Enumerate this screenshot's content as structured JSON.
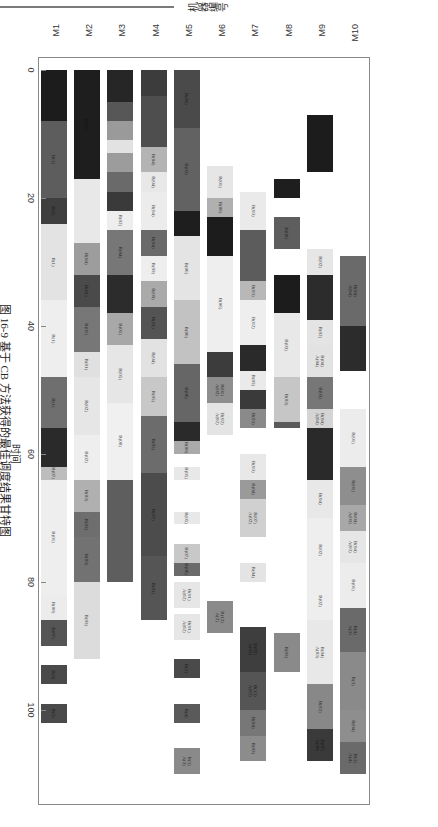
{
  "chart_data": {
    "type": "gantt",
    "title": "",
    "caption": "图 16-9 基于 CB 方法获得的最佳调度结果甘特图",
    "xlabel": "时间",
    "ylabel": "机器编号",
    "xlim": [
      0,
      117
    ],
    "xticks": [
      0,
      20,
      40,
      60,
      80,
      100
    ],
    "grid": false,
    "legend": null,
    "machines": [
      "M1",
      "M2",
      "M3",
      "M4",
      "M5",
      "M6",
      "M7",
      "M8",
      "M9",
      "M10"
    ],
    "tasks": [
      {
        "machine": "M1",
        "start": 0,
        "end": 8,
        "label": "",
        "color": "#1c1c1c"
      },
      {
        "machine": "M1",
        "start": 8,
        "end": 20,
        "label": "B(1)",
        "color": "#5d5d5d"
      },
      {
        "machine": "M1",
        "start": 20,
        "end": 24,
        "label": "B(2)",
        "color": "#3f3f3f"
      },
      {
        "machine": "M1",
        "start": 24,
        "end": 36,
        "label": "B(1)",
        "color": "#e3e3e3"
      },
      {
        "machine": "M1",
        "start": 36,
        "end": 48,
        "label": "B(1)",
        "color": "#eeeeee"
      },
      {
        "machine": "M1",
        "start": 48,
        "end": 56,
        "label": "B(1)",
        "color": "#6f6f6f"
      },
      {
        "machine": "M1",
        "start": 56,
        "end": 62,
        "label": "",
        "color": "#2a2a2a"
      },
      {
        "machine": "M1",
        "start": 62,
        "end": 64,
        "label": "B(07)",
        "color": "#bdbdbd"
      },
      {
        "machine": "M1",
        "start": 64,
        "end": 82,
        "label": "B(01)",
        "color": "#eeeeee"
      },
      {
        "machine": "M1",
        "start": 82,
        "end": 86,
        "label": "B(08)",
        "color": "#ececec"
      },
      {
        "machine": "M1",
        "start": 86,
        "end": 90,
        "label": "B(07)",
        "color": "#555555"
      },
      {
        "machine": "M1",
        "start": 93,
        "end": 96,
        "label": "B(3)",
        "color": "#4a4a4a"
      },
      {
        "machine": "M1",
        "start": 99,
        "end": 102,
        "label": "B(3)",
        "color": "#4a4a4a"
      },
      {
        "machine": "M2",
        "start": 0,
        "end": 17,
        "label": "B(01)",
        "color": "#1e1e1e"
      },
      {
        "machine": "M2",
        "start": 17,
        "end": 27,
        "label": "",
        "color": "#e8e8e8"
      },
      {
        "machine": "M2",
        "start": 27,
        "end": 32,
        "label": "B(04)",
        "color": "#9d9d9d"
      },
      {
        "machine": "M2",
        "start": 32,
        "end": 37,
        "label": "B(01)",
        "color": "#4a4a4a"
      },
      {
        "machine": "M2",
        "start": 37,
        "end": 44,
        "label": "B(01)",
        "color": "#777777"
      },
      {
        "machine": "M2",
        "start": 44,
        "end": 48,
        "label": "B(01)",
        "color": "#e0e0e0"
      },
      {
        "machine": "M2",
        "start": 48,
        "end": 57,
        "label": "B(02)",
        "color": "#e6e6e6"
      },
      {
        "machine": "M2",
        "start": 57,
        "end": 64,
        "label": "B(02)",
        "color": "#eeeeee"
      },
      {
        "machine": "M2",
        "start": 64,
        "end": 69,
        "label": "B(03)",
        "color": "#b0b0b0"
      },
      {
        "machine": "M2",
        "start": 69,
        "end": 73,
        "label": "B(03)",
        "color": "#6e6e6e"
      },
      {
        "machine": "M2",
        "start": 73,
        "end": 80,
        "label": "B(03)",
        "color": "#727272"
      },
      {
        "machine": "M2",
        "start": 80,
        "end": 92,
        "label": "B(03)",
        "color": "#dcdcdc"
      },
      {
        "machine": "M3",
        "start": 0,
        "end": 5,
        "label": "",
        "color": "#262626"
      },
      {
        "machine": "M3",
        "start": 5,
        "end": 8,
        "label": "",
        "color": "#575757"
      },
      {
        "machine": "M3",
        "start": 8,
        "end": 11,
        "label": "",
        "color": "#9a9a9a"
      },
      {
        "machine": "M3",
        "start": 11,
        "end": 13,
        "label": "",
        "color": "#e2e2e2"
      },
      {
        "machine": "M3",
        "start": 13,
        "end": 16,
        "label": "",
        "color": "#9c9c9c"
      },
      {
        "machine": "M3",
        "start": 16,
        "end": 19,
        "label": "",
        "color": "#6a6a6a"
      },
      {
        "machine": "M3",
        "start": 19,
        "end": 22,
        "label": "",
        "color": "#3a3a3a"
      },
      {
        "machine": "M3",
        "start": 22,
        "end": 25,
        "label": "B(02)",
        "color": "#eeeeee"
      },
      {
        "machine": "M3",
        "start": 25,
        "end": 32,
        "label": "B(04)",
        "color": "#777777"
      },
      {
        "machine": "M3",
        "start": 32,
        "end": 38,
        "label": "",
        "color": "#2c2c2c"
      },
      {
        "machine": "M3",
        "start": 38,
        "end": 43,
        "label": "B(05)",
        "color": "#a8a8a8"
      },
      {
        "machine": "M3",
        "start": 43,
        "end": 52,
        "label": "B(05)",
        "color": "#e6e6e6"
      },
      {
        "machine": "M3",
        "start": 52,
        "end": 64,
        "label": "B(08)",
        "color": "#f0f0f0"
      },
      {
        "machine": "M3",
        "start": 64,
        "end": 80,
        "label": "",
        "color": "#5e5e5e"
      },
      {
        "machine": "M4",
        "start": 0,
        "end": 4,
        "label": "",
        "color": "#3c3c3c"
      },
      {
        "machine": "M4",
        "start": 4,
        "end": 12,
        "label": "",
        "color": "#4e4e4e"
      },
      {
        "machine": "M4",
        "start": 12,
        "end": 16,
        "label": "B(04)",
        "color": "#b4b4b4"
      },
      {
        "machine": "M4",
        "start": 16,
        "end": 19,
        "label": "B(04)",
        "color": "#e8e8e8"
      },
      {
        "machine": "M4",
        "start": 19,
        "end": 25,
        "label": "B(04)",
        "color": "#ececec"
      },
      {
        "machine": "M4",
        "start": 25,
        "end": 29,
        "label": "B(04)",
        "color": "#6a6a6a"
      },
      {
        "machine": "M4",
        "start": 29,
        "end": 33,
        "label": "B(09)",
        "color": "#eeeeee"
      },
      {
        "machine": "M4",
        "start": 33,
        "end": 37,
        "label": "B(09)",
        "color": "#aaaaaa"
      },
      {
        "machine": "M4",
        "start": 37,
        "end": 42,
        "label": "B(01)",
        "color": "#545454"
      },
      {
        "machine": "M4",
        "start": 42,
        "end": 48,
        "label": "B(04)",
        "color": "#e2e2e2"
      },
      {
        "machine": "M4",
        "start": 48,
        "end": 54,
        "label": "B(05)",
        "color": "#c8c8c8"
      },
      {
        "machine": "M4",
        "start": 54,
        "end": 63,
        "label": "B(05)",
        "color": "#6c6c6c"
      },
      {
        "machine": "M4",
        "start": 63,
        "end": 76,
        "label": "B(07)",
        "color": "#4c4c4c"
      },
      {
        "machine": "M4",
        "start": 76,
        "end": 86,
        "label": "B(01)",
        "color": "#555555"
      },
      {
        "machine": "M5",
        "start": 0,
        "end": 9,
        "label": "B(06)",
        "color": "#4a4a4a"
      },
      {
        "machine": "M5",
        "start": 9,
        "end": 22,
        "label": "B(02)",
        "color": "#626262"
      },
      {
        "machine": "M5",
        "start": 22,
        "end": 26,
        "label": "",
        "color": "#1e1e1e"
      },
      {
        "machine": "M5",
        "start": 26,
        "end": 36,
        "label": "B(06)",
        "color": "#e4e4e4"
      },
      {
        "machine": "M5",
        "start": 36,
        "end": 46,
        "label": "B(06)",
        "color": "#c2c2c2"
      },
      {
        "machine": "M5",
        "start": 46,
        "end": 55,
        "label": "B(06)",
        "color": "#666666"
      },
      {
        "machine": "M5",
        "start": 55,
        "end": 58,
        "label": "",
        "color": "#2a2a2a"
      },
      {
        "machine": "M5",
        "start": 58,
        "end": 60,
        "label": "B(08)",
        "color": "#aaaaaa"
      },
      {
        "machine": "M5",
        "start": 62,
        "end": 64,
        "label": "B(05)",
        "color": "#e8e8e8"
      },
      {
        "machine": "M5",
        "start": 69,
        "end": 71,
        "label": "B(05)",
        "color": "#e8e8e8"
      },
      {
        "machine": "M5",
        "start": 74,
        "end": 77,
        "label": "B(07)",
        "color": "#c8c8c8"
      },
      {
        "machine": "M5",
        "start": 77,
        "end": 79,
        "label": "B(06)",
        "color": "#6a6a6a"
      },
      {
        "machine": "M5",
        "start": 80,
        "end": 84,
        "label": "B(01)\nA(02)",
        "color": "#e6e6e6"
      },
      {
        "machine": "M5",
        "start": 85,
        "end": 89,
        "label": "B(01)\nA(02)",
        "color": "#e6e6e6"
      },
      {
        "machine": "M5",
        "start": 92,
        "end": 95,
        "label": "B(1)",
        "color": "#4a4a4a"
      },
      {
        "machine": "M5",
        "start": 99,
        "end": 102,
        "label": "B(4)",
        "color": "#5a5a5a"
      },
      {
        "machine": "M5",
        "start": 106,
        "end": 110,
        "label": "B(3)\nA(3)",
        "color": "#8a8a8a"
      },
      {
        "machine": "M6",
        "start": 15,
        "end": 20,
        "label": "B(01)",
        "color": "#e6e6e6"
      },
      {
        "machine": "M6",
        "start": 20,
        "end": 23,
        "label": "B(06)",
        "color": "#b0b0b0"
      },
      {
        "machine": "M6",
        "start": 23,
        "end": 29,
        "label": "",
        "color": "#1c1c1c"
      },
      {
        "machine": "M6",
        "start": 29,
        "end": 44,
        "label": "B(06)",
        "color": "#eeeeee"
      },
      {
        "machine": "M6",
        "start": 44,
        "end": 48,
        "label": "",
        "color": "#3c3c3c"
      },
      {
        "machine": "M6",
        "start": 48,
        "end": 52,
        "label": "B(01)\nA(02)",
        "color": "#8e8e8e"
      },
      {
        "machine": "M6",
        "start": 52,
        "end": 57,
        "label": "B(02)\nA(02)",
        "color": "#e4e4e4"
      },
      {
        "machine": "M6",
        "start": 83,
        "end": 88,
        "label": "B(12)\nA(2)",
        "color": "#8a8a8a"
      },
      {
        "machine": "M7",
        "start": 19,
        "end": 25,
        "label": "B(03)",
        "color": "#eaeaea"
      },
      {
        "machine": "M7",
        "start": 25,
        "end": 33,
        "label": "",
        "color": "#5c5c5c"
      },
      {
        "machine": "M7",
        "start": 33,
        "end": 36,
        "label": "B(03)",
        "color": "#b8b8b8"
      },
      {
        "machine": "M7",
        "start": 36,
        "end": 43,
        "label": "B(02)",
        "color": "#eeeeee"
      },
      {
        "machine": "M7",
        "start": 43,
        "end": 47,
        "label": "",
        "color": "#2a2a2a"
      },
      {
        "machine": "M7",
        "start": 47,
        "end": 50,
        "label": "B(03)",
        "color": "#eaeaea"
      },
      {
        "machine": "M7",
        "start": 50,
        "end": 53,
        "label": "",
        "color": "#3a3a3a"
      },
      {
        "machine": "M7",
        "start": 53,
        "end": 56,
        "label": "B(03)",
        "color": "#8a8a8a"
      },
      {
        "machine": "M7",
        "start": 60,
        "end": 64,
        "label": "B(03)",
        "color": "#e8e8e8"
      },
      {
        "machine": "M7",
        "start": 64,
        "end": 67,
        "label": "B(04)",
        "color": "#9a9a9a"
      },
      {
        "machine": "M7",
        "start": 67,
        "end": 73,
        "label": "B(07)\nA(02)",
        "color": "#d0d0d0"
      },
      {
        "machine": "M7",
        "start": 77,
        "end": 80,
        "label": "B(04)",
        "color": "#e4e4e4"
      },
      {
        "machine": "M7",
        "start": 87,
        "end": 94,
        "label": "B(02)\nA(02)",
        "color": "#3e3e3e"
      },
      {
        "machine": "M7",
        "start": 94,
        "end": 100,
        "label": "B(13)\nA(02)",
        "color": "#555555"
      },
      {
        "machine": "M7",
        "start": 100,
        "end": 104,
        "label": "B(04)",
        "color": "#777777"
      },
      {
        "machine": "M7",
        "start": 104,
        "end": 108,
        "label": "B(03)",
        "color": "#8c8c8c"
      },
      {
        "machine": "M8",
        "start": 17,
        "end": 20,
        "label": "",
        "color": "#1e1e1e"
      },
      {
        "machine": "M8",
        "start": 23,
        "end": 28,
        "label": "B(08)",
        "color": "#5e5e5e"
      },
      {
        "machine": "M8",
        "start": 32,
        "end": 38,
        "label": "",
        "color": "#1c1c1c"
      },
      {
        "machine": "M8",
        "start": 38,
        "end": 48,
        "label": "B(03)",
        "color": "#e8e8e8"
      },
      {
        "machine": "M8",
        "start": 48,
        "end": 55,
        "label": "B(03)",
        "color": "#c6c6c6"
      },
      {
        "machine": "M8",
        "start": 55,
        "end": 56,
        "label": "",
        "color": "#5a5a5a"
      },
      {
        "machine": "M8",
        "start": 88,
        "end": 94,
        "label": "B(03)",
        "color": "#8a8a8a"
      },
      {
        "machine": "M9",
        "start": 7,
        "end": 16,
        "label": "",
        "color": "#1c1c1c"
      },
      {
        "machine": "M9",
        "start": 28,
        "end": 32,
        "label": "B(02)",
        "color": "#e6e6e6"
      },
      {
        "machine": "M9",
        "start": 32,
        "end": 39,
        "label": "",
        "color": "#2c2c2c"
      },
      {
        "machine": "M9",
        "start": 39,
        "end": 43,
        "label": "B(02)",
        "color": "#e4e4e4"
      },
      {
        "machine": "M9",
        "start": 43,
        "end": 48,
        "label": "B(04)\nA(04)",
        "color": "#e2e2e2"
      },
      {
        "machine": "M9",
        "start": 48,
        "end": 53,
        "label": "B(03)",
        "color": "#777777"
      },
      {
        "machine": "M9",
        "start": 53,
        "end": 56,
        "label": "B(04)\nA(04)",
        "color": "#d4d4d4"
      },
      {
        "machine": "M9",
        "start": 56,
        "end": 64,
        "label": "",
        "color": "#2a2a2a"
      },
      {
        "machine": "M9",
        "start": 64,
        "end": 70,
        "label": "B(04)",
        "color": "#e8e8e8"
      },
      {
        "machine": "M9",
        "start": 70,
        "end": 80,
        "label": "B(02)",
        "color": "#eeeeee"
      },
      {
        "machine": "M9",
        "start": 80,
        "end": 86,
        "label": "B(02)",
        "color": "#eeeeee"
      },
      {
        "machine": "M9",
        "start": 86,
        "end": 96,
        "label": "B(04)\nA(03)",
        "color": "#e8e8e8"
      },
      {
        "machine": "M9",
        "start": 96,
        "end": 103,
        "label": "B(02)",
        "color": "#888888"
      },
      {
        "machine": "M9",
        "start": 103,
        "end": 108,
        "label": "B(07)\nA(08)",
        "color": "#3a3a3a"
      },
      {
        "machine": "M10",
        "start": 29,
        "end": 40,
        "label": "B(04)\nA(04)",
        "color": "#6a6a6a"
      },
      {
        "machine": "M10",
        "start": 40,
        "end": 47,
        "label": "",
        "color": "#2c2c2c"
      },
      {
        "machine": "M10",
        "start": 53,
        "end": 62,
        "label": "B(01)",
        "color": "#ececec"
      },
      {
        "machine": "M10",
        "start": 62,
        "end": 68,
        "label": "B(01)",
        "color": "#8e8e8e"
      },
      {
        "machine": "M10",
        "start": 68,
        "end": 72,
        "label": "B(04)\nA(03)",
        "color": "#a8a8a8"
      },
      {
        "machine": "M10",
        "start": 72,
        "end": 77,
        "label": "B(04)\nA(03)",
        "color": "#e6e6e6"
      },
      {
        "machine": "M10",
        "start": 77,
        "end": 84,
        "label": "B(01)",
        "color": "#ececec"
      },
      {
        "machine": "M10",
        "start": 84,
        "end": 91,
        "label": "B(4)\nA(3)",
        "color": "#6a6a6a"
      },
      {
        "machine": "M10",
        "start": 91,
        "end": 100,
        "label": "B(3)",
        "color": "#8a8a8a"
      },
      {
        "machine": "M10",
        "start": 100,
        "end": 105,
        "label": "B(04)",
        "color": "#8e8e8e"
      },
      {
        "machine": "M10",
        "start": 105,
        "end": 110,
        "label": "B(3)\nA(4)",
        "color": "#6a6a6a"
      }
    ]
  }
}
